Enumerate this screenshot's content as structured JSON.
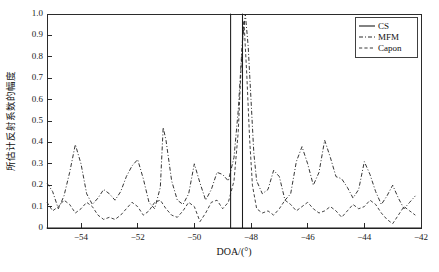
{
  "chart_data": {
    "type": "line",
    "title": "",
    "xlabel": "DOA/(°)",
    "ylabel": "所估计反射系数的幅度",
    "xlim": [
      -55.2,
      -42.0
    ],
    "ylim": [
      0,
      1.0
    ],
    "grid": false,
    "legend_position": "top-right",
    "xticks": [
      -54,
      -52,
      -50,
      -48,
      -46,
      -44,
      -42
    ],
    "xticklabels": [
      "−54",
      "−52",
      "−50",
      "−48",
      "−46",
      "−44",
      "−42"
    ],
    "yticks": [
      0,
      0.1,
      0.2,
      0.3,
      0.4,
      0.5,
      0.6,
      0.7,
      0.8,
      0.9,
      1.0
    ],
    "yticklabels": [
      "0",
      "0.1",
      "0.2",
      "0.3",
      "0.4",
      "0.5",
      "0.6",
      "0.7",
      "0.8",
      "0.9",
      "1.0"
    ],
    "series": [
      {
        "name": "CS",
        "style": "solid",
        "description": "Two sparse spikes reaching magnitude 1.0 at the true DOAs",
        "x": [
          -55.2,
          -48.72,
          -48.72,
          -48.72,
          -48.3,
          -48.3,
          -48.3,
          -42.0
        ],
        "values": [
          0,
          0,
          1.0,
          0,
          0,
          1.0,
          0,
          0
        ]
      },
      {
        "name": "MFM",
        "style": "dashdot",
        "description": "Sharp main lobe peaking at 1.0 with moderate sidelobes 0.05-0.47",
        "x": [
          -55.2,
          -55.0,
          -54.8,
          -54.6,
          -54.4,
          -54.2,
          -54.0,
          -53.8,
          -53.6,
          -53.4,
          -53.2,
          -53.0,
          -52.8,
          -52.6,
          -52.4,
          -52.2,
          -52.0,
          -51.8,
          -51.6,
          -51.4,
          -51.2,
          -51.1,
          -51.0,
          -50.8,
          -50.6,
          -50.4,
          -50.2,
          -50.0,
          -49.8,
          -49.6,
          -49.4,
          -49.2,
          -49.0,
          -48.8,
          -48.6,
          -48.45,
          -48.3,
          -48.2,
          -48.1,
          -48.0,
          -47.9,
          -47.8,
          -47.6,
          -47.4,
          -47.2,
          -47.0,
          -46.8,
          -46.6,
          -46.4,
          -46.2,
          -46.0,
          -45.8,
          -45.6,
          -45.4,
          -45.2,
          -45.0,
          -44.8,
          -44.6,
          -44.4,
          -44.2,
          -44.0,
          -43.8,
          -43.6,
          -43.4,
          -43.2,
          -43.0,
          -42.8,
          -42.6,
          -42.4,
          -42.2
        ],
        "values": [
          0.21,
          0.17,
          0.09,
          0.15,
          0.26,
          0.39,
          0.3,
          0.16,
          0.11,
          0.14,
          0.18,
          0.16,
          0.13,
          0.17,
          0.24,
          0.29,
          0.32,
          0.23,
          0.12,
          0.09,
          0.19,
          0.47,
          0.41,
          0.22,
          0.13,
          0.11,
          0.16,
          0.3,
          0.21,
          0.13,
          0.18,
          0.26,
          0.25,
          0.22,
          0.33,
          0.55,
          0.88,
          1.0,
          0.85,
          0.6,
          0.35,
          0.22,
          0.16,
          0.18,
          0.27,
          0.24,
          0.13,
          0.16,
          0.31,
          0.38,
          0.3,
          0.2,
          0.26,
          0.41,
          0.33,
          0.24,
          0.23,
          0.19,
          0.14,
          0.18,
          0.31,
          0.25,
          0.17,
          0.11,
          0.15,
          0.2,
          0.14,
          0.09,
          0.12,
          0.15
        ]
      },
      {
        "name": "Capon",
        "style": "dashed",
        "description": "Broad low-level spectrum, baseline 0.03-0.15 with main lobe peak near 1.0",
        "x": [
          -55.2,
          -55.0,
          -54.8,
          -54.6,
          -54.4,
          -54.2,
          -54.0,
          -53.8,
          -53.6,
          -53.4,
          -53.2,
          -53.0,
          -52.8,
          -52.6,
          -52.4,
          -52.2,
          -52.0,
          -51.8,
          -51.6,
          -51.4,
          -51.2,
          -51.0,
          -50.8,
          -50.6,
          -50.4,
          -50.2,
          -50.0,
          -49.8,
          -49.6,
          -49.4,
          -49.2,
          -49.0,
          -48.8,
          -48.6,
          -48.45,
          -48.35,
          -48.25,
          -48.15,
          -48.05,
          -47.95,
          -47.8,
          -47.6,
          -47.4,
          -47.2,
          -47.0,
          -46.8,
          -46.6,
          -46.4,
          -46.2,
          -46.0,
          -45.8,
          -45.6,
          -45.4,
          -45.2,
          -45.0,
          -44.8,
          -44.6,
          -44.4,
          -44.2,
          -44.0,
          -43.8,
          -43.6,
          -43.4,
          -43.2,
          -43.0,
          -42.8,
          -42.6,
          -42.4,
          -42.2
        ],
        "values": [
          0.12,
          0.08,
          0.1,
          0.13,
          0.11,
          0.07,
          0.09,
          0.12,
          0.1,
          0.06,
          0.04,
          0.05,
          0.04,
          0.06,
          0.09,
          0.12,
          0.1,
          0.06,
          0.08,
          0.12,
          0.13,
          0.09,
          0.06,
          0.05,
          0.08,
          0.12,
          0.1,
          0.03,
          0.07,
          0.12,
          0.13,
          0.09,
          0.12,
          0.22,
          0.45,
          0.75,
          0.97,
          0.72,
          0.42,
          0.2,
          0.09,
          0.07,
          0.08,
          0.06,
          0.09,
          0.13,
          0.11,
          0.08,
          0.1,
          0.12,
          0.09,
          0.07,
          0.08,
          0.1,
          0.08,
          0.05,
          0.08,
          0.11,
          0.09,
          0.1,
          0.13,
          0.11,
          0.07,
          0.04,
          0.02,
          0.06,
          0.1,
          0.08,
          0.06
        ]
      }
    ],
    "legend": [
      "CS",
      "MFM",
      "Capon"
    ]
  },
  "colors": {
    "axis": "#2b2b2b",
    "cs": "#1c1c1c",
    "mfm": "#2a2a2a",
    "capon": "#3a3a3a",
    "background": "#ffffff"
  }
}
